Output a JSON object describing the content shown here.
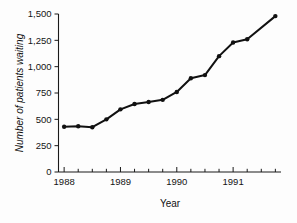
{
  "chart_data": {
    "type": "line",
    "title": "",
    "xlabel": "Year",
    "ylabel": "Number of patients waiting",
    "xlim": [
      1987.9,
      1991.85
    ],
    "ylim": [
      0,
      1500
    ],
    "grid": false,
    "legend": false,
    "y_ticks": [
      0,
      250,
      500,
      750,
      1000,
      1250,
      1500
    ],
    "y_tick_labels": [
      "0",
      "250",
      "500",
      "750",
      "1,000",
      "1,250",
      "1,500"
    ],
    "x_ticks": [
      1988,
      1989,
      1990,
      1991
    ],
    "x_tick_labels": [
      "1988",
      "1989",
      "1990",
      "1991"
    ],
    "x_minor_ticks": [
      1988.25,
      1988.5,
      1988.75,
      1989.25,
      1989.5,
      1989.75,
      1990.25,
      1990.5,
      1990.75,
      1991.25,
      1991.5,
      1991.75
    ],
    "x": [
      1988.0,
      1988.25,
      1988.5,
      1988.75,
      1989.0,
      1989.25,
      1989.5,
      1989.75,
      1990.0,
      1990.25,
      1990.5,
      1990.75,
      1991.0,
      1991.25,
      1991.75
    ],
    "values": [
      430,
      435,
      425,
      500,
      595,
      645,
      665,
      685,
      760,
      890,
      920,
      1100,
      1230,
      1260,
      1480
    ],
    "series": [
      {
        "name": "Number of patients waiting",
        "marker": "filled-circle",
        "color": "#111111",
        "values": [
          430,
          435,
          425,
          500,
          595,
          645,
          665,
          685,
          760,
          890,
          920,
          1100,
          1230,
          1260,
          1480
        ]
      }
    ]
  }
}
